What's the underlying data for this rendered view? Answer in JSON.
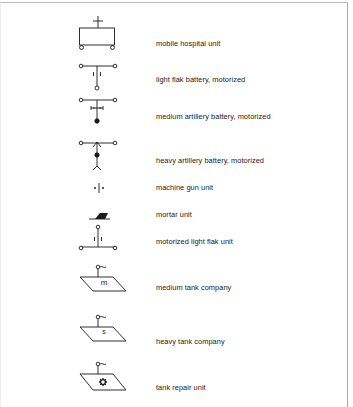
{
  "legend": {
    "items": [
      {
        "id": "mobile-hospital-unit",
        "label": "mobile hospital unit",
        "icon": "mobile-hospital-icon"
      },
      {
        "id": "light-flak-battery-motorized",
        "label": "light flak battery, motorized",
        "icon": "light-flak-battery-icon"
      },
      {
        "id": "medium-artillery-battery-motorized",
        "label": "medium artillery battery, motorized",
        "icon": "medium-artillery-battery-icon"
      },
      {
        "id": "heavy-artillery-battery-motorized",
        "label": "heavy artillery battery, motorized",
        "icon": "heavy-artillery-battery-icon"
      },
      {
        "id": "machine-gun-unit",
        "label": "machine gun unit",
        "icon": "machine-gun-icon"
      },
      {
        "id": "mortar-unit",
        "label": "mortar unit",
        "icon": "mortar-icon"
      },
      {
        "id": "motorized-light-flak-unit",
        "label": "motorized light flak unit",
        "icon": "motorized-light-flak-icon"
      },
      {
        "id": "medium-tank-company",
        "label": "medium tank company",
        "icon": "medium-tank-icon",
        "mark": "m"
      },
      {
        "id": "heavy-tank-company",
        "label": "heavy tank company",
        "icon": "heavy-tank-icon",
        "mark": "s"
      },
      {
        "id": "tank-repair-unit",
        "label": "tank repair unit",
        "icon": "tank-repair-icon"
      }
    ]
  },
  "colors": {
    "ink": "#1a1a1a",
    "frame": "#b0b0b0",
    "background": "#ffffff"
  }
}
